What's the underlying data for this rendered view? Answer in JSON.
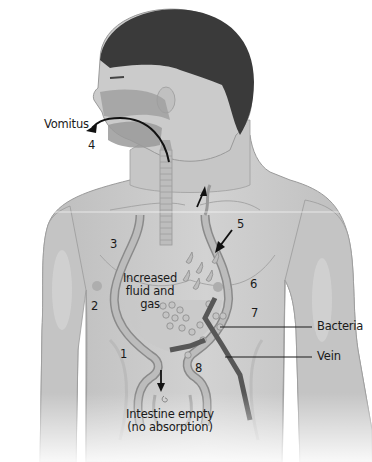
{
  "diagram": {
    "type": "anatomical-illustration",
    "colors": {
      "background": "#ffffff",
      "skin": "#c9c9c9",
      "skin_shadow": "#b3b3b3",
      "hair": "#3a3a3a",
      "tract": "#a8a8a8",
      "tract_outline": "#8a8a8a",
      "vein": "#555555",
      "text": "#1a1a1a"
    },
    "labels": {
      "vomitus": "Vomitus",
      "increased_fluid": "Increased fluid and gas",
      "increased_fluid_line1": "Increased",
      "increased_fluid_line2": "fluid and",
      "increased_fluid_line3": "gas",
      "bacteria": "Bacteria",
      "vein": "Vein",
      "intestine_line1": "Intestine empty",
      "intestine_line2": "(no absorption)"
    },
    "numbers": {
      "n1": "1",
      "n2": "2",
      "n3": "3",
      "n4": "4",
      "n5": "5",
      "n6": "6",
      "n7": "7",
      "n8": "8"
    },
    "arrows": [
      {
        "name": "vomitus-arrow",
        "direction": "out of mouth, leftward"
      },
      {
        "name": "upward-arrow",
        "direction": "up the esophagus"
      },
      {
        "name": "inward-arrow-5",
        "direction": "down-left into stomach"
      },
      {
        "name": "downward-arrow",
        "direction": "down into intestine"
      }
    ]
  }
}
